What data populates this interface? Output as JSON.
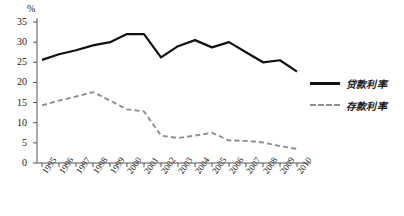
{
  "chart_data": {
    "type": "line",
    "title": "",
    "xlabel": "",
    "ylabel": "%",
    "ylim": [
      0,
      35
    ],
    "ytick_values": [
      0,
      5,
      10,
      15,
      20,
      25,
      30,
      35
    ],
    "grid": false,
    "legend_position": "right",
    "categories": [
      "1995",
      "1996",
      "1997",
      "1998",
      "1999",
      "2000",
      "2001",
      "2002",
      "2003",
      "2004",
      "2005",
      "2006",
      "2007",
      "2008",
      "2009",
      "2010"
    ],
    "series": [
      {
        "name": "贷款利率",
        "style": "solid",
        "color": "#111111",
        "values": [
          25.6,
          27.0,
          28.0,
          29.2,
          30.0,
          32.0,
          32.0,
          26.2,
          29.0,
          30.5,
          28.7,
          30.0,
          27.5,
          25.0,
          25.5,
          22.7
        ]
      },
      {
        "name": "存款利率",
        "style": "dashed",
        "color": "#8d8d8d",
        "values": [
          14.3,
          15.5,
          16.5,
          17.6,
          15.5,
          13.3,
          12.8,
          6.8,
          6.2,
          6.8,
          7.5,
          5.6,
          5.5,
          5.1,
          4.2,
          3.5
        ]
      }
    ]
  },
  "axis": {
    "unit_label": "%"
  },
  "legend": {
    "items": [
      {
        "label": "贷款利率",
        "style": "solid"
      },
      {
        "label": "存款利率",
        "style": "dashed"
      }
    ]
  }
}
